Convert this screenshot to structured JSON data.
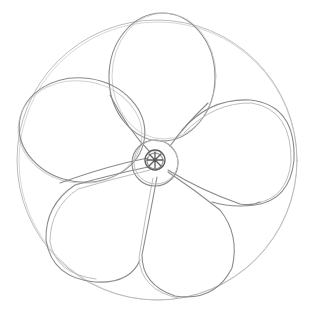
{
  "image": {
    "title": "Pencil sketch of five-petal flower",
    "description": "Hand-drawn pencil sketch on white paper: a large outer guide circle enclosing five rounded petals arranged radially around a small double-ringed center with radial strokes.",
    "subject": "flower",
    "petal_count": 5,
    "colors": {
      "background": "#ffffff",
      "line_light": "#bdbdbd",
      "line_mid": "#8a8a8a",
      "line_dark": "#5a5a5a"
    },
    "geometry": {
      "outer_circle": {
        "cx": 157,
        "cy": 160,
        "r": 140
      },
      "center_outer_ring": {
        "cx": 155,
        "cy": 163,
        "r": 23
      },
      "center_inner_ring": {
        "cx": 155,
        "cy": 160,
        "r": 10
      },
      "petals": [
        {
          "name": "top",
          "cx": 162,
          "cy": 77,
          "rx": 53,
          "ry": 64
        },
        {
          "name": "upper-left",
          "cx": 82,
          "cy": 130,
          "rx": 63,
          "ry": 52
        },
        {
          "name": "right",
          "cx": 242,
          "cy": 150,
          "rx": 58,
          "ry": 60
        },
        {
          "name": "lower-left",
          "cx": 95,
          "cy": 230,
          "rx": 53,
          "ry": 58
        },
        {
          "name": "lower-right",
          "cx": 188,
          "cy": 242,
          "rx": 50,
          "ry": 57
        }
      ]
    }
  }
}
